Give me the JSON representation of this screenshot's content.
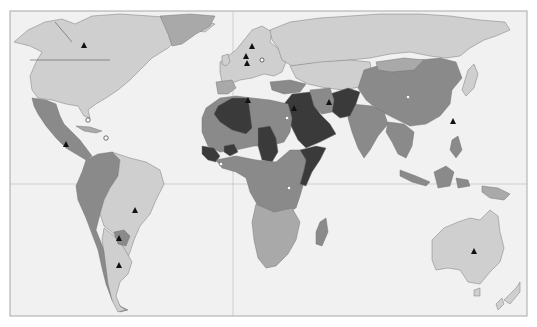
{
  "map": {
    "type": "choropleth-world-map",
    "projection": "equirectangular-like",
    "frame": {
      "x": 10,
      "y": 11,
      "width": 517,
      "height": 305
    },
    "gridlines": {
      "equator_y": 236,
      "prime_meridian_x": 233
    },
    "legend": null,
    "color_scale": {
      "light": "#cfcfcf",
      "medium": "#a9a9a9",
      "mid_dark": "#8a8a8a",
      "dark": "#3a3a3a",
      "ocean": "#f1f1f1",
      "frame_border": "#a8a8a8"
    },
    "regions": [
      {
        "name": "North America (Canada/USA)",
        "shade": "light"
      },
      {
        "name": "Greenland",
        "shade": "medium"
      },
      {
        "name": "Mexico & Central America",
        "shade": "mid_dark"
      },
      {
        "name": "Brazil",
        "shade": "light"
      },
      {
        "name": "Argentina",
        "shade": "light"
      },
      {
        "name": "Andean South America",
        "shade": "mid_dark"
      },
      {
        "name": "Paraguay",
        "shade": "mid_dark"
      },
      {
        "name": "Europe",
        "shade": "light"
      },
      {
        "name": "Russia",
        "shade": "light"
      },
      {
        "name": "Central Asia",
        "shade": "light"
      },
      {
        "name": "China",
        "shade": "mid_dark"
      },
      {
        "name": "India",
        "shade": "mid_dark"
      },
      {
        "name": "Southeast Asia",
        "shade": "mid_dark"
      },
      {
        "name": "Japan",
        "shade": "light"
      },
      {
        "name": "Algeria",
        "shade": "dark"
      },
      {
        "name": "Libya/Egypt region",
        "shade": "mid_dark"
      },
      {
        "name": "Sahel (Chad, Burkina Faso)",
        "shade": "dark"
      },
      {
        "name": "West Africa coast",
        "shade": "dark"
      },
      {
        "name": "Saudi Arabia & Iraq",
        "shade": "dark"
      },
      {
        "name": "Iran",
        "shade": "mid_dark"
      },
      {
        "name": "Pakistan/Afghanistan",
        "shade": "dark"
      },
      {
        "name": "Horn of Africa (Somalia)",
        "shade": "dark"
      },
      {
        "name": "Central & East Africa",
        "shade": "mid_dark"
      },
      {
        "name": "Southern Africa",
        "shade": "medium"
      },
      {
        "name": "Madagascar",
        "shade": "mid_dark"
      },
      {
        "name": "Indonesia",
        "shade": "mid_dark"
      },
      {
        "name": "Papua New Guinea",
        "shade": "medium"
      },
      {
        "name": "Australia",
        "shade": "light"
      },
      {
        "name": "New Zealand",
        "shade": "light"
      }
    ],
    "markers": [
      {
        "type": "triangle",
        "x": 84,
        "y": 46,
        "label": "Canada"
      },
      {
        "type": "triangle",
        "x": 252,
        "y": 47,
        "label": "Scandinavia"
      },
      {
        "type": "triangle",
        "x": 246,
        "y": 57,
        "label": "Northern Europe"
      },
      {
        "type": "triangle",
        "x": 247,
        "y": 64,
        "label": "Western Europe"
      },
      {
        "type": "triangle",
        "x": 248,
        "y": 100,
        "label": "Algeria"
      },
      {
        "type": "triangle",
        "x": 66,
        "y": 145,
        "label": "Central America"
      },
      {
        "type": "triangle",
        "x": 135,
        "y": 211,
        "label": "Brazil"
      },
      {
        "type": "triangle",
        "x": 119,
        "y": 239,
        "label": "Paraguay"
      },
      {
        "type": "triangle",
        "x": 119,
        "y": 266,
        "label": "Argentina"
      },
      {
        "type": "triangle",
        "x": 329,
        "y": 103,
        "label": "Iran"
      },
      {
        "type": "triangle",
        "x": 294,
        "y": 109,
        "label": "Middle East"
      },
      {
        "type": "triangle",
        "x": 453,
        "y": 122,
        "label": "Taiwan"
      },
      {
        "type": "triangle",
        "x": 474,
        "y": 252,
        "label": "Australia"
      },
      {
        "type": "circle",
        "x": 88,
        "y": 120,
        "label": "Florida"
      },
      {
        "type": "circle",
        "x": 106,
        "y": 138,
        "label": "Caribbean"
      },
      {
        "type": "circle",
        "x": 262,
        "y": 60,
        "label": "Eastern Europe"
      },
      {
        "type": "square",
        "x": 287,
        "y": 118,
        "label": "Egypt"
      },
      {
        "type": "square",
        "x": 408,
        "y": 97,
        "label": "China"
      },
      {
        "type": "square",
        "x": 221,
        "y": 164,
        "label": "West Africa"
      },
      {
        "type": "square",
        "x": 289,
        "y": 188,
        "label": "East Africa"
      }
    ]
  }
}
